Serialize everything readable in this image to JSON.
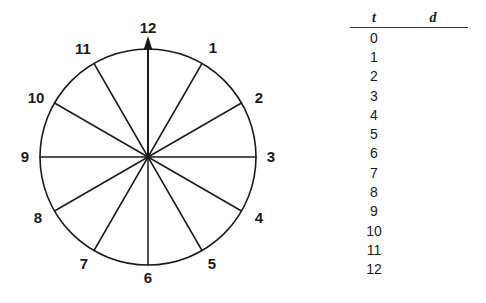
{
  "figure": {
    "type": "clock-diagram",
    "circle": {
      "center_x": 148,
      "center_y": 157,
      "radius": 108,
      "stroke": "#1a1a1a"
    },
    "arrow": {
      "points_to": "12",
      "direction": "up",
      "from": "center"
    },
    "hour_labels": [
      {
        "label": "12",
        "angle_deg": 0
      },
      {
        "label": "1",
        "angle_deg": 30
      },
      {
        "label": "2",
        "angle_deg": 60
      },
      {
        "label": "3",
        "angle_deg": 90
      },
      {
        "label": "4",
        "angle_deg": 120
      },
      {
        "label": "5",
        "angle_deg": 150
      },
      {
        "label": "6",
        "angle_deg": 180
      },
      {
        "label": "7",
        "angle_deg": 210
      },
      {
        "label": "8",
        "angle_deg": 240
      },
      {
        "label": "9",
        "angle_deg": 270
      },
      {
        "label": "10",
        "angle_deg": 300
      },
      {
        "label": "11",
        "angle_deg": 330
      }
    ]
  },
  "table": {
    "headers": {
      "t": "t",
      "d": "d"
    },
    "rows": [
      {
        "t": "0",
        "d": ""
      },
      {
        "t": "1",
        "d": ""
      },
      {
        "t": "2",
        "d": ""
      },
      {
        "t": "3",
        "d": ""
      },
      {
        "t": "4",
        "d": ""
      },
      {
        "t": "5",
        "d": ""
      },
      {
        "t": "6",
        "d": ""
      },
      {
        "t": "7",
        "d": ""
      },
      {
        "t": "8",
        "d": ""
      },
      {
        "t": "9",
        "d": ""
      },
      {
        "t": "10",
        "d": ""
      },
      {
        "t": "11",
        "d": ""
      },
      {
        "t": "12",
        "d": ""
      }
    ]
  },
  "colors": {
    "ink": "#1a1a1a",
    "rule": "#333333",
    "background": "#ffffff"
  }
}
